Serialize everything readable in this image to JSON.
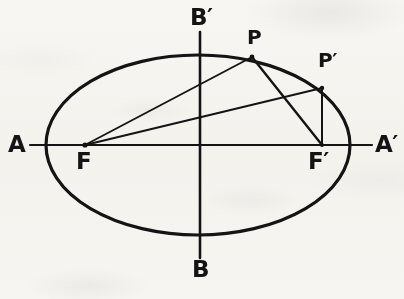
{
  "figure": {
    "kind": "geometry-diagram",
    "background_color": "#fbfaf8",
    "ink_color": "#141414"
  },
  "labels": {
    "vertex_left": "A",
    "vertex_right": "A′",
    "covertex_top": "B′",
    "covertex_bottom": "B",
    "focus_left": "F",
    "focus_right": "F′",
    "point_p": "P",
    "point_p_prime": "P′"
  },
  "geometry": {
    "center": {
      "x": 198,
      "y": 145
    },
    "semi_major_axis": 152,
    "semi_minor_axis": 90,
    "major_axis_line": {
      "x1": 30,
      "y1": 145,
      "x2": 372,
      "y2": 145
    },
    "minor_axis_line": {
      "x1": 200,
      "y1": 32,
      "x2": 200,
      "y2": 258
    },
    "points": {
      "A": {
        "x": 46,
        "y": 145
      },
      "A_prime": {
        "x": 350,
        "y": 145
      },
      "B_prime": {
        "x": 199,
        "y": 55
      },
      "B": {
        "x": 199,
        "y": 235
      },
      "F": {
        "x": 85,
        "y": 145
      },
      "F_prime": {
        "x": 322,
        "y": 145
      },
      "P": {
        "x": 252,
        "y": 57
      },
      "P_prime": {
        "x": 322,
        "y": 88
      }
    },
    "segments": [
      {
        "name": "F-P",
        "x1": 85,
        "y1": 145,
        "x2": 252,
        "y2": 57
      },
      {
        "name": "P-F-prime",
        "x1": 252,
        "y1": 57,
        "x2": 322,
        "y2": 145
      },
      {
        "name": "F-P-prime",
        "x1": 85,
        "y1": 145,
        "x2": 322,
        "y2": 88
      },
      {
        "name": "P-prime-F-prime",
        "x1": 322,
        "y1": 88,
        "x2": 322,
        "y2": 145
      }
    ]
  },
  "label_positions": {
    "A": {
      "x": 8,
      "y": 133
    },
    "A_prime": {
      "x": 375,
      "y": 133
    },
    "B_prime": {
      "x": 190,
      "y": 6
    },
    "B": {
      "x": 192,
      "y": 258
    },
    "F": {
      "x": 76,
      "y": 150
    },
    "F_prime": {
      "x": 308,
      "y": 150
    },
    "P": {
      "x": 247,
      "y": 27
    },
    "P_prime": {
      "x": 318,
      "y": 50
    }
  }
}
